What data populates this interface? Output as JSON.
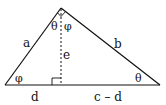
{
  "diagram": {
    "type": "right-triangle-altitude",
    "stroke_color": "#111111",
    "background": "#ffffff",
    "vertices": {
      "left": [
        5,
        85
      ],
      "right": [
        160,
        85
      ],
      "apex": [
        61,
        8
      ],
      "altitude_foot": [
        61,
        85
      ]
    },
    "labels": {
      "side_left": "a",
      "side_right": "b",
      "altitude": "e",
      "base_left_segment": "d",
      "base_right_segment": "c – d",
      "apex_left_angle": "θ",
      "apex_right_angle": "φ",
      "left_base_angle": "φ",
      "right_base_angle": "θ"
    }
  }
}
